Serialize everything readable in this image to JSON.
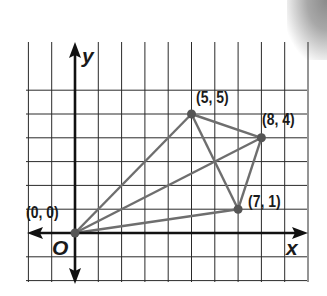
{
  "diagram": {
    "type": "coordinate-plane",
    "axes": {
      "x_label": "x",
      "y_label": "y",
      "origin_label": "O"
    },
    "grid": {
      "x_range": [
        -2,
        10
      ],
      "y_range": [
        -2,
        6
      ],
      "unit": 1
    },
    "points": [
      {
        "id": "P0",
        "label": "(0, 0)",
        "x": 0,
        "y": 0
      },
      {
        "id": "P1",
        "label": "(5, 5)",
        "x": 5,
        "y": 5
      },
      {
        "id": "P2",
        "label": "(8, 4)",
        "x": 8,
        "y": 4
      },
      {
        "id": "P3",
        "label": "(7, 1)",
        "x": 7,
        "y": 1
      }
    ],
    "segments": [
      [
        "P0",
        "P1"
      ],
      [
        "P0",
        "P2"
      ],
      [
        "P0",
        "P3"
      ],
      [
        "P1",
        "P2"
      ],
      [
        "P2",
        "P3"
      ],
      [
        "P1",
        "P3"
      ]
    ],
    "colors": {
      "grid": "#2a2a2a",
      "axes": "#111111",
      "segments": "#6e6e6e",
      "points": "#555555"
    }
  }
}
